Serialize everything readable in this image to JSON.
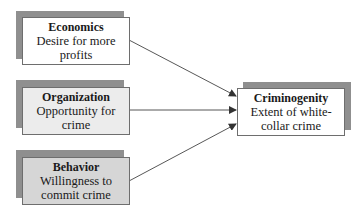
{
  "diagram": {
    "type": "causal-flow",
    "sources": [
      {
        "id": "economics",
        "title": "Economics",
        "description": "Desire for more profits",
        "lines": [
          "Desire for more",
          "profits"
        ],
        "fill": "#ffffff"
      },
      {
        "id": "organization",
        "title": "Organization",
        "description": "Opportunity for crime",
        "lines": [
          "Opportunity for",
          "crime"
        ],
        "fill": "#ececec"
      },
      {
        "id": "behavior",
        "title": "Behavior",
        "description": "Willingness to commit crime",
        "lines": [
          "Willingness to",
          "commit crime"
        ],
        "fill": "#d6d6d6"
      }
    ],
    "target": {
      "id": "criminogenity",
      "title": "Criminogenity",
      "description": "Extent of white-collar crime",
      "lines": [
        "Extent of white-",
        "collar crime"
      ],
      "fill": "#ffffff"
    },
    "edges": [
      {
        "from": "economics",
        "to": "criminogenity"
      },
      {
        "from": "organization",
        "to": "criminogenity"
      },
      {
        "from": "behavior",
        "to": "criminogenity"
      }
    ],
    "colors": {
      "shadow": "#8f8f8f",
      "border": "#6e6e6e",
      "arrow": "#333333"
    }
  }
}
